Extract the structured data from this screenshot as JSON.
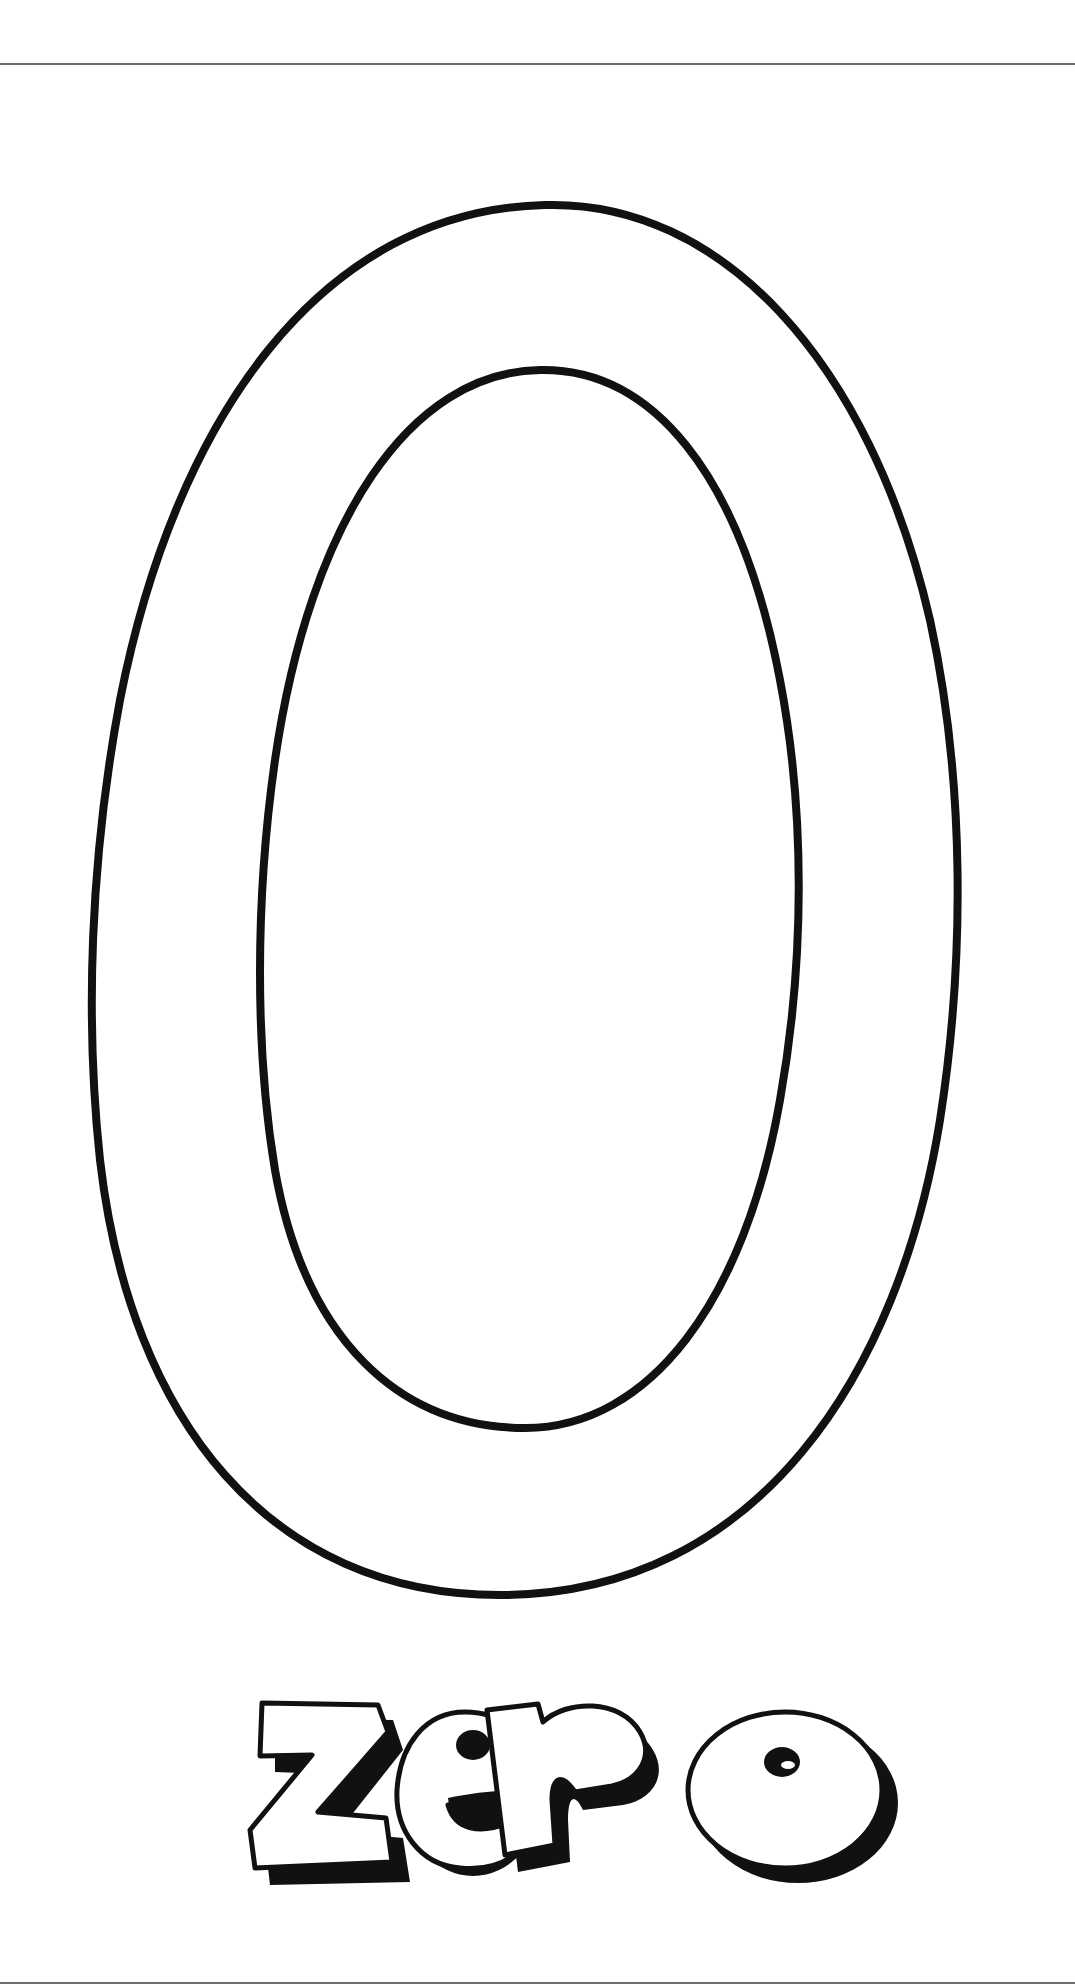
{
  "page": {
    "type": "coloring-page",
    "numeral": "0",
    "word": "zero",
    "colors": {
      "background": "#ffffff",
      "outline": "#111111",
      "rule": "#6e6e6e"
    }
  }
}
